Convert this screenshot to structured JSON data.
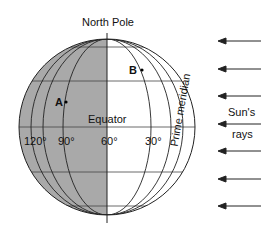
{
  "diagram": {
    "title_label": "North Pole",
    "equator_label": "Equator",
    "prime_meridian_label": "Prime meridian",
    "points": [
      {
        "label": "A"
      },
      {
        "label": "B"
      }
    ],
    "longitudes": [
      {
        "label": "120°"
      },
      {
        "label": "90°"
      },
      {
        "label": "60°"
      },
      {
        "label": "30°"
      }
    ],
    "sun_label_line1": "Sun's",
    "sun_label_line2": "rays",
    "colors": {
      "night_side": "#a9a9a9",
      "day_side": "#ffffff",
      "lines": "#222222"
    }
  }
}
